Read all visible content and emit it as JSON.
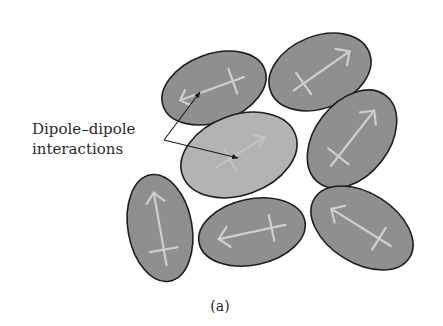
{
  "figure": {
    "label_line1": "Dipole–dipole",
    "label_line2": "interactions",
    "caption": "(a)"
  },
  "colors": {
    "background": "#ffffff",
    "molecule_fill": "#8f8f8f",
    "molecule_fill_highlight": "#b3b3b3",
    "molecule_stroke": "#1e1e1e",
    "dipole_arrow": "#cfcfcf",
    "pointer_arrow": "#1a1a1a"
  },
  "molecules": [
    {
      "id": "top-left",
      "cx": 214,
      "cy": 88,
      "rx": 54,
      "ry": 34,
      "rotation": -20,
      "dipole_direction": "left",
      "highlight": false
    },
    {
      "id": "top-right",
      "cx": 320,
      "cy": 72,
      "rx": 53,
      "ry": 36,
      "rotation": -22,
      "dipole_direction": "up-right",
      "highlight": false
    },
    {
      "id": "center",
      "cx": 239,
      "cy": 155,
      "rx": 60,
      "ry": 40,
      "rotation": -20,
      "dipole_direction": "up-right",
      "highlight": true
    },
    {
      "id": "right",
      "cx": 352,
      "cy": 139,
      "rx": 55,
      "ry": 37,
      "rotation": -52,
      "dipole_direction": "up-right",
      "highlight": false
    },
    {
      "id": "bottom-left",
      "cx": 160,
      "cy": 228,
      "rx": 32,
      "ry": 54,
      "rotation": -10,
      "dipole_direction": "up",
      "highlight": false
    },
    {
      "id": "bottom-middle",
      "cx": 252,
      "cy": 232,
      "rx": 54,
      "ry": 33,
      "rotation": -12,
      "dipole_direction": "left",
      "highlight": false
    },
    {
      "id": "bottom-right",
      "cx": 362,
      "cy": 228,
      "rx": 56,
      "ry": 35,
      "rotation": 32,
      "dipole_direction": "up-left",
      "highlight": false
    }
  ]
}
